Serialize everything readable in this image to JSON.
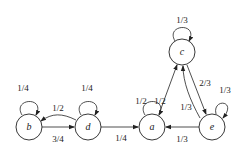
{
  "diagram": {
    "type": "markov-chain-state-diagram",
    "nodes": [
      {
        "id": "b",
        "label": "b"
      },
      {
        "id": "d",
        "label": "d"
      },
      {
        "id": "a",
        "label": "a"
      },
      {
        "id": "c",
        "label": "c"
      },
      {
        "id": "e",
        "label": "e"
      }
    ],
    "edges": [
      {
        "from": "b",
        "to": "b",
        "label": "1/4"
      },
      {
        "from": "d",
        "to": "d",
        "label": "1/4"
      },
      {
        "from": "d",
        "to": "b",
        "label": "1/2"
      },
      {
        "from": "b",
        "to": "d",
        "label": "3/4"
      },
      {
        "from": "d",
        "to": "a",
        "label": "1/4"
      },
      {
        "from": "a",
        "to": "a",
        "label": "1/2"
      },
      {
        "from": "a",
        "to": "c",
        "label": "1/2"
      },
      {
        "from": "c",
        "to": "c",
        "label": "1/3"
      },
      {
        "from": "c",
        "to": "e",
        "label": "2/3"
      },
      {
        "from": "e",
        "to": "c",
        "label": "1/3"
      },
      {
        "from": "e",
        "to": "e",
        "label": "1/3"
      },
      {
        "from": "e",
        "to": "a",
        "label": "1/3"
      }
    ]
  }
}
